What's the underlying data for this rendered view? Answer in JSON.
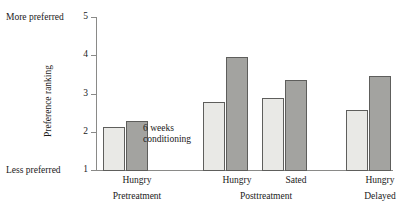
{
  "chart_data": {
    "type": "bar",
    "title": "",
    "xlabel": "",
    "ylabel": "Preference ranking",
    "ylim": [
      1,
      5
    ],
    "yticks": [
      1,
      2,
      3,
      4,
      5
    ],
    "ytick_labels": [
      "1",
      "2",
      "3",
      "4",
      "5"
    ],
    "grid": false,
    "legend": "none",
    "axis_end_labels": {
      "top": "More preferred",
      "bottom": "Less preferred"
    },
    "annotations": [
      {
        "text_line1": "6 weeks",
        "text_line2": "conditioning"
      }
    ],
    "categories": [
      "Hungry",
      "Hungry",
      "Sated",
      "Hungry"
    ],
    "group_labels": [
      "Pretreatment",
      "Posttreatment",
      "Delayed"
    ],
    "series": [
      {
        "name": "light",
        "values": [
          2.12,
          2.78,
          2.88,
          2.57
        ]
      },
      {
        "name": "dark",
        "values": [
          2.28,
          3.95,
          3.35,
          3.45
        ]
      }
    ],
    "bars": [
      {
        "group": "Pretreatment",
        "category": "Hungry",
        "shade": "light",
        "value": 2.12
      },
      {
        "group": "Pretreatment",
        "category": "Hungry",
        "shade": "dark",
        "value": 2.28
      },
      {
        "group": "Posttreatment",
        "category": "Hungry",
        "shade": "light",
        "value": 2.78
      },
      {
        "group": "Posttreatment",
        "category": "Hungry",
        "shade": "dark",
        "value": 3.95
      },
      {
        "group": "Posttreatment",
        "category": "Sated",
        "shade": "light",
        "value": 2.88
      },
      {
        "group": "Posttreatment",
        "category": "Sated",
        "shade": "dark",
        "value": 3.35
      },
      {
        "group": "Delayed",
        "category": "Hungry",
        "shade": "light",
        "value": 2.57
      },
      {
        "group": "Delayed",
        "category": "Hungry",
        "shade": "dark",
        "value": 3.45
      }
    ],
    "colors": {
      "light_bar": "#e9e9e6",
      "dark_bar": "#a3a3a0",
      "bar_outline": "#5e5e5c",
      "axis": "#8a8a88",
      "text": "#1a1a1a",
      "background": "#ffffff"
    }
  }
}
